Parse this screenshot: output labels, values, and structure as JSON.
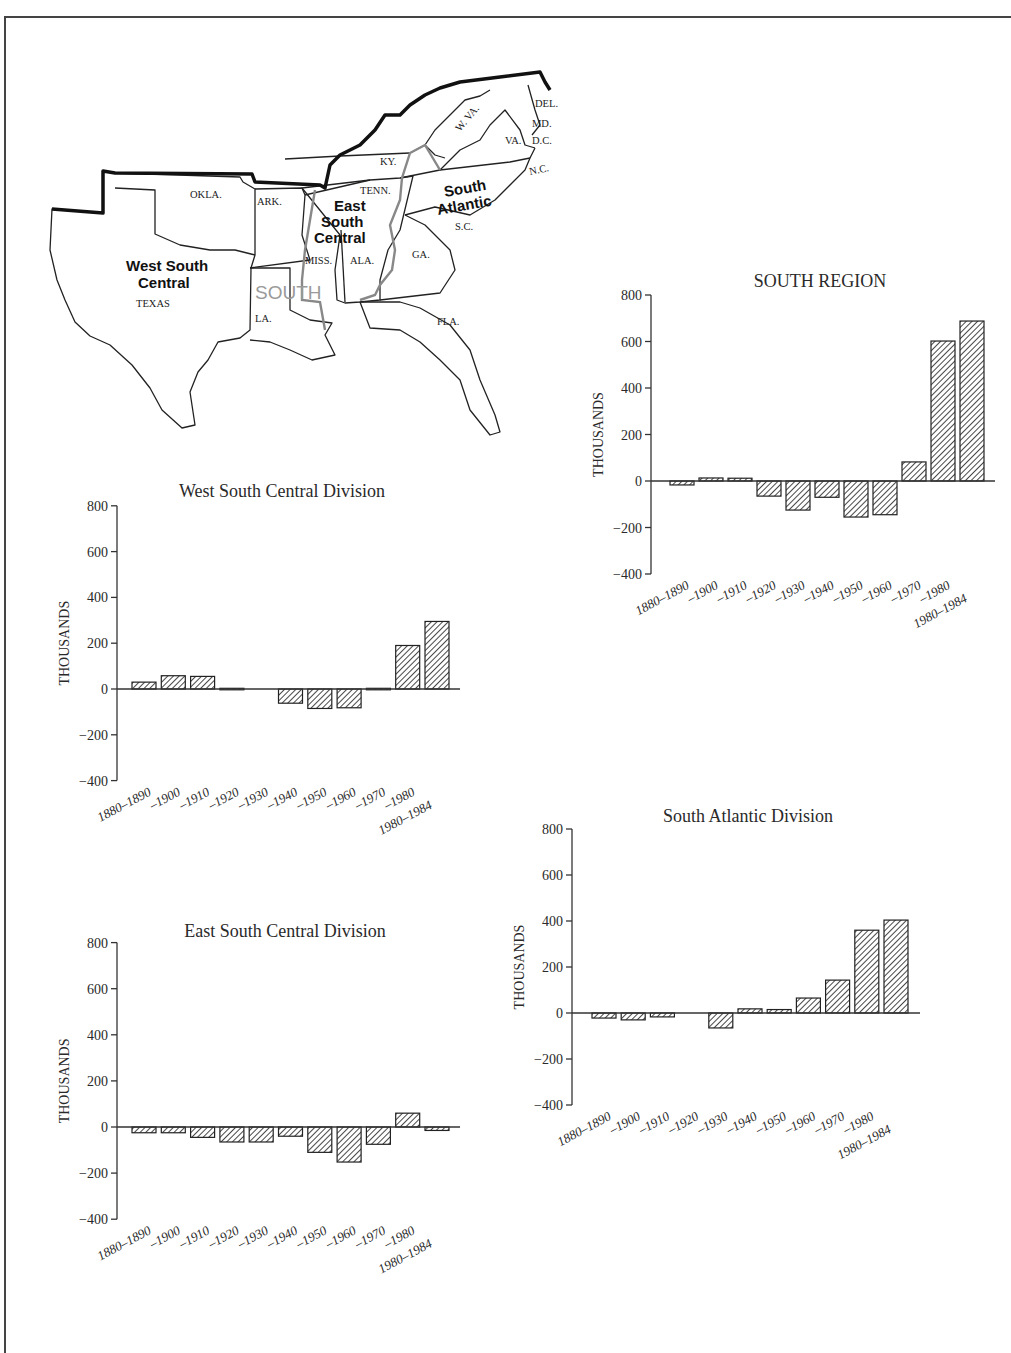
{
  "map": {
    "region_label": "SOUTH",
    "divisions": [
      {
        "name": "West South Central",
        "lines": [
          "West South",
          "Central"
        ]
      },
      {
        "name": "East South Central",
        "lines": [
          "East",
          "South",
          "Central"
        ]
      },
      {
        "name": "South Atlantic",
        "lines": [
          "South",
          "Atlantic"
        ]
      }
    ],
    "states": [
      "OKLA.",
      "ARK.",
      "TEXAS",
      "LA.",
      "MISS.",
      "ALA.",
      "TENN.",
      "KY.",
      "W. VA.",
      "VA.",
      "N.C.",
      "S.C.",
      "GA.",
      "FLA.",
      "DEL.",
      "MD.",
      "D.C."
    ]
  },
  "chart_data": [
    {
      "id": "south-region",
      "type": "bar",
      "title": "SOUTH REGION",
      "xlabel": "",
      "ylabel": "THOUSANDS",
      "ylim": [
        -400,
        800
      ],
      "yticks": [
        800,
        600,
        400,
        200,
        0,
        -200,
        -400
      ],
      "ytick_labels": [
        "800",
        "600",
        "400",
        "200",
        "0",
        "−200",
        "−400"
      ],
      "categories": [
        "1880–1890",
        "–1900",
        "–1910",
        "–1920",
        "–1930",
        "–1940",
        "–1950",
        "–1960",
        "–1970",
        "–1980",
        "1980–1984"
      ],
      "values": [
        -17,
        13,
        12,
        -65,
        -125,
        -70,
        -155,
        -145,
        82,
        602,
        688
      ],
      "grid": false,
      "legend": "none"
    },
    {
      "id": "west-south-central",
      "type": "bar",
      "title": "West South Central Division",
      "xlabel": "",
      "ylabel": "THOUSANDS",
      "ylim": [
        -400,
        800
      ],
      "yticks": [
        800,
        600,
        400,
        200,
        0,
        -200,
        -400
      ],
      "ytick_labels": [
        "800",
        "600",
        "400",
        "200",
        "0",
        "−200",
        "−400"
      ],
      "categories": [
        "1880–1890",
        "–1900",
        "–1910",
        "–1920",
        "–1930",
        "–1940",
        "–1950",
        "–1960",
        "–1970",
        "–1980",
        "1980–1984"
      ],
      "values": [
        30,
        58,
        55,
        3,
        0,
        -62,
        -85,
        -82,
        3,
        190,
        295
      ],
      "grid": false,
      "legend": "none"
    },
    {
      "id": "east-south-central",
      "type": "bar",
      "title": "East South Central Division",
      "xlabel": "",
      "ylabel": "THOUSANDS",
      "ylim": [
        -400,
        800
      ],
      "yticks": [
        800,
        600,
        400,
        200,
        0,
        -200,
        -400
      ],
      "ytick_labels": [
        "800",
        "600",
        "400",
        "200",
        "0",
        "−200",
        "−400"
      ],
      "categories": [
        "1880–1890",
        "–1900",
        "–1910",
        "–1920",
        "–1930",
        "–1940",
        "–1950",
        "–1960",
        "–1970",
        "–1980",
        "1980–1984"
      ],
      "values": [
        -25,
        -25,
        -45,
        -65,
        -65,
        -40,
        -110,
        -152,
        -75,
        60,
        -15
      ],
      "grid": false,
      "legend": "none"
    },
    {
      "id": "south-atlantic",
      "type": "bar",
      "title": "South Atlantic Division",
      "xlabel": "",
      "ylabel": "THOUSANDS",
      "ylim": [
        -400,
        800
      ],
      "yticks": [
        800,
        600,
        400,
        200,
        0,
        -200,
        -400
      ],
      "ytick_labels": [
        "800",
        "600",
        "400",
        "200",
        "0",
        "−200",
        "−400"
      ],
      "categories": [
        "1880–1890",
        "–1900",
        "–1910",
        "–1920",
        "–1930",
        "–1940",
        "–1950",
        "–1960",
        "–1970",
        "–1980",
        "1980–1984"
      ],
      "values": [
        -22,
        -30,
        -17,
        0,
        -65,
        18,
        15,
        65,
        143,
        360,
        404
      ],
      "grid": false,
      "legend": "none"
    }
  ],
  "layout": {
    "charts": {
      "south-region": {
        "left": 575,
        "top": 265,
        "axis_x": 76,
        "zero_y": 216,
        "px_per_unit": 0.2325,
        "bar_start": 95,
        "bar_step": 29,
        "bar_w": 24,
        "axis_end": 420,
        "title_x": 245,
        "title_y": 22
      },
      "west-south-central": {
        "left": 40,
        "top": 475,
        "axis_x": 77,
        "zero_y": 214,
        "px_per_unit": 0.229,
        "bar_start": 92,
        "bar_step": 29.3,
        "bar_w": 24,
        "axis_end": 420,
        "title_x": 242,
        "title_y": 22
      },
      "east-south-central": {
        "left": 40,
        "top": 915,
        "axis_x": 77,
        "zero_y": 212,
        "px_per_unit": 0.2305,
        "bar_start": 92,
        "bar_step": 29.3,
        "bar_w": 24,
        "axis_end": 420,
        "title_x": 245,
        "title_y": 22
      },
      "south-atlantic": {
        "left": 500,
        "top": 800,
        "axis_x": 72,
        "zero_y": 213,
        "px_per_unit": 0.23,
        "bar_start": 92,
        "bar_step": 29.2,
        "bar_w": 24,
        "axis_end": 420,
        "title_x": 248,
        "title_y": 22
      }
    }
  }
}
